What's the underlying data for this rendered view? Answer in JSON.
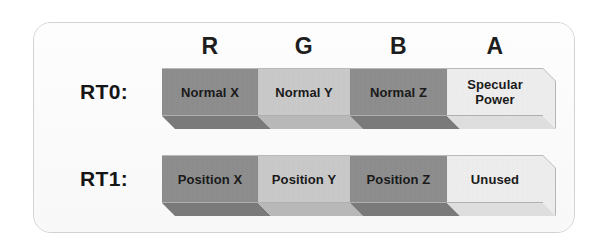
{
  "diagram": {
    "channel_headers": [
      "R",
      "G",
      "B",
      "A"
    ],
    "colors": {
      "dark_gray": "#8d8d8d",
      "light_gray": "#c9c9c9",
      "pale_gray": "#ededed",
      "dark_gray_shade": "#7a7a7a",
      "light_gray_shade": "#b8b8b8",
      "pale_gray_shade": "#dedede",
      "card_border": "#d2d2d2",
      "card_background": "#fbfbfb",
      "text": "#1a1a1a"
    },
    "rows": [
      {
        "label": "RT0:",
        "segments": [
          {
            "channel": "R",
            "text": "Normal X",
            "line2": "",
            "tone": "dark"
          },
          {
            "channel": "G",
            "text": "Normal Y",
            "line2": "",
            "tone": "light"
          },
          {
            "channel": "B",
            "text": "Normal Z",
            "line2": "",
            "tone": "dark"
          },
          {
            "channel": "A",
            "text": "Specular",
            "line2": "Power",
            "tone": "pale"
          }
        ]
      },
      {
        "label": "RT1:",
        "segments": [
          {
            "channel": "R",
            "text": "Position X",
            "line2": "",
            "tone": "dark"
          },
          {
            "channel": "G",
            "text": "Position Y",
            "line2": "",
            "tone": "light"
          },
          {
            "channel": "B",
            "text": "Position Z",
            "line2": "",
            "tone": "dark"
          },
          {
            "channel": "A",
            "text": "Unused",
            "line2": "",
            "tone": "pale"
          }
        ]
      }
    ]
  }
}
